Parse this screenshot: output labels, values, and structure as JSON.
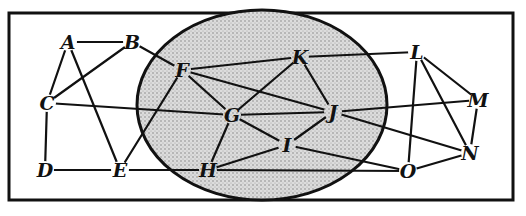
{
  "diagram": {
    "type": "graph",
    "frame": {
      "x": 9,
      "y": 13,
      "width": 504,
      "height": 187
    },
    "region": {
      "shape": "ellipse",
      "cx": 262,
      "cy": 105,
      "rx": 125,
      "ry": 95,
      "fill": "#d4d4d4",
      "stippled": true
    },
    "colors": {
      "ink": "#111111",
      "background": "#ffffff",
      "region_fill": "#d4d4d4"
    },
    "nodes": [
      {
        "id": "A",
        "label": "A",
        "x": 68,
        "y": 42
      },
      {
        "id": "B",
        "label": "B",
        "x": 132,
        "y": 42
      },
      {
        "id": "C",
        "label": "C",
        "x": 47,
        "y": 103
      },
      {
        "id": "D",
        "label": "D",
        "x": 45,
        "y": 170
      },
      {
        "id": "E",
        "label": "E",
        "x": 120,
        "y": 170
      },
      {
        "id": "F",
        "label": "F",
        "x": 182,
        "y": 70
      },
      {
        "id": "G",
        "label": "G",
        "x": 232,
        "y": 115
      },
      {
        "id": "H",
        "label": "H",
        "x": 208,
        "y": 170
      },
      {
        "id": "I",
        "label": "I",
        "x": 287,
        "y": 145
      },
      {
        "id": "J",
        "label": "J",
        "x": 333,
        "y": 112
      },
      {
        "id": "K",
        "label": "K",
        "x": 300,
        "y": 57
      },
      {
        "id": "L",
        "label": "L",
        "x": 417,
        "y": 52
      },
      {
        "id": "M",
        "label": "M",
        "x": 478,
        "y": 100
      },
      {
        "id": "N",
        "label": "N",
        "x": 470,
        "y": 153
      },
      {
        "id": "O",
        "label": "O",
        "x": 408,
        "y": 171
      }
    ],
    "edges": [
      [
        "A",
        "B"
      ],
      [
        "A",
        "C"
      ],
      [
        "A",
        "E"
      ],
      [
        "B",
        "C"
      ],
      [
        "B",
        "F"
      ],
      [
        "C",
        "D"
      ],
      [
        "C",
        "G"
      ],
      [
        "D",
        "E"
      ],
      [
        "E",
        "F"
      ],
      [
        "E",
        "H"
      ],
      [
        "F",
        "G"
      ],
      [
        "F",
        "K"
      ],
      [
        "F",
        "J"
      ],
      [
        "G",
        "H"
      ],
      [
        "G",
        "K"
      ],
      [
        "G",
        "I"
      ],
      [
        "G",
        "J"
      ],
      [
        "H",
        "I"
      ],
      [
        "H",
        "O"
      ],
      [
        "I",
        "J"
      ],
      [
        "I",
        "O"
      ],
      [
        "K",
        "J"
      ],
      [
        "K",
        "L"
      ],
      [
        "J",
        "M"
      ],
      [
        "J",
        "N"
      ],
      [
        "L",
        "M"
      ],
      [
        "L",
        "N"
      ],
      [
        "L",
        "O"
      ],
      [
        "M",
        "N"
      ],
      [
        "N",
        "O"
      ]
    ]
  }
}
